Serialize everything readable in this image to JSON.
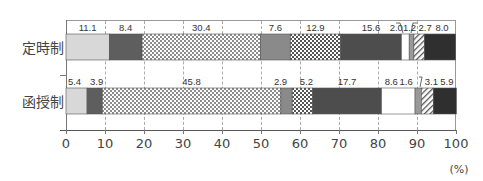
{
  "chart_data": {
    "type": "bar",
    "orientation": "horizontal",
    "stacked": true,
    "normalized": true,
    "title": "",
    "xlabel": "(%)",
    "ylabel": "",
    "xlim": [
      0,
      100
    ],
    "x_ticks": [
      "0",
      "10",
      "20",
      "30",
      "40",
      "50",
      "60",
      "70",
      "80",
      "90",
      "100"
    ],
    "grid": {
      "vertical": true,
      "style": "dashed"
    },
    "legend": null,
    "categories": [
      "定時制",
      "函授制"
    ],
    "series": [
      {
        "name": "segment-1",
        "pattern": "light-gray",
        "color": "#d8d8d8",
        "values": [
          11.1,
          5.4
        ]
      },
      {
        "name": "segment-2",
        "pattern": "dark-gray",
        "color": "#5e5e5e",
        "values": [
          8.4,
          3.9
        ]
      },
      {
        "name": "segment-3",
        "pattern": "dots",
        "color": "#ffffff",
        "values": [
          30.4,
          45.8
        ]
      },
      {
        "name": "segment-4",
        "pattern": "mid-gray",
        "color": "#8a8a8a",
        "values": [
          7.6,
          2.9
        ]
      },
      {
        "name": "segment-5",
        "pattern": "checker",
        "color": "#ffffff",
        "values": [
          12.9,
          5.2
        ]
      },
      {
        "name": "segment-6",
        "pattern": "dark-gray",
        "color": "#4d4d4d",
        "values": [
          15.6,
          17.7
        ]
      },
      {
        "name": "segment-7",
        "pattern": "white",
        "color": "#ffffff",
        "values": [
          2.0,
          8.6
        ]
      },
      {
        "name": "segment-8",
        "pattern": "mid-gray",
        "color": "#999999",
        "values": [
          1.2,
          1.6
        ]
      },
      {
        "name": "segment-9",
        "pattern": "diagonal-hatch",
        "color": "#ffffff",
        "values": [
          2.7,
          3.1
        ]
      },
      {
        "name": "segment-10",
        "pattern": "near-black",
        "color": "#2f2f2f",
        "values": [
          8.0,
          5.9
        ]
      }
    ],
    "annotations": [
      "2.0 and 1.2 / 2.7 labels use leader lines (定時制)",
      "1.6 label uses leader line (函授制)"
    ]
  },
  "labels": {
    "row1": "定時制",
    "row2": "函授制",
    "unit": "(%)",
    "row1_values": [
      "11.1",
      "8.4",
      "30.4",
      "7.6",
      "12.9",
      "15.6",
      "2.0",
      "1.2",
      "2.7",
      "8.0"
    ],
    "row2_values": [
      "5.4",
      "3.9",
      "45.8",
      "2.9",
      "5.2",
      "17.7",
      "8.6",
      "1.6",
      "3.1",
      "5.9"
    ],
    "ticks": [
      "0",
      "10",
      "20",
      "30",
      "40",
      "50",
      "60",
      "70",
      "80",
      "90",
      "100"
    ]
  }
}
